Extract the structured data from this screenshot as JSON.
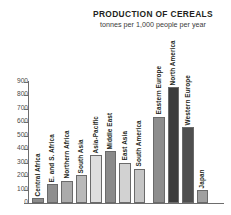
{
  "chart_data": {
    "type": "bar",
    "title": "PRODUCTION OF CEREALS",
    "subtitle": "tonnes per 1,000 people per year",
    "xlabel": "",
    "ylabel": "",
    "ylim": [
      0,
      900
    ],
    "yticks": [
      0,
      100,
      200,
      300,
      400,
      500,
      600,
      700,
      800,
      900
    ],
    "ytick_labels": [
      "0",
      "100",
      "200",
      "300",
      "400",
      "500",
      "600",
      "700",
      "800",
      "900"
    ],
    "grid": false,
    "legend": "none",
    "categories": [
      "Central Africa",
      "E. and S. Africa",
      "Northern Africa",
      "South Asia",
      "Asia-Pacific",
      "Middle East",
      "East Asia",
      "South America",
      "Eastern Europe",
      "North America",
      "Western Europe",
      "Japan"
    ],
    "values": [
      35,
      140,
      165,
      205,
      355,
      385,
      300,
      255,
      640,
      860,
      560,
      95
    ],
    "bar_colors": [
      "#8c8c8c",
      "#8f8f8f",
      "#ababab",
      "#b9b9b9",
      "#dedede",
      "#8a8a8a",
      "#d2d2d2",
      "#c5c5c5",
      "#8d8d8d",
      "#3c3c3c",
      "#4f4f4f",
      "#a0a0a0"
    ]
  },
  "axis": {
    "axis_color": "#6d6d6d",
    "tick_text_color": "#4a4a4a"
  },
  "style": {
    "background": "#ffffff",
    "text_color": "#231f20"
  }
}
